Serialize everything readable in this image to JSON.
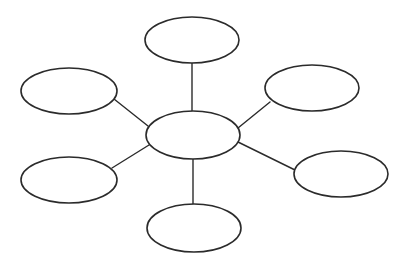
{
  "diagram": {
    "type": "bubble-map",
    "background": "#ffffff",
    "stroke_color": "#2b2b2b",
    "center": {
      "id": "center",
      "cx": 193,
      "cy": 135,
      "rx": 47,
      "ry": 24,
      "label": ""
    },
    "nodes": [
      {
        "id": "top",
        "cx": 192,
        "cy": 40,
        "rx": 47,
        "ry": 23,
        "label": ""
      },
      {
        "id": "top-left",
        "cx": 69,
        "cy": 91,
        "rx": 48,
        "ry": 23,
        "label": ""
      },
      {
        "id": "top-right",
        "cx": 312,
        "cy": 88,
        "rx": 47,
        "ry": 23,
        "label": ""
      },
      {
        "id": "bottom-left",
        "cx": 69,
        "cy": 180,
        "rx": 48,
        "ry": 23,
        "label": ""
      },
      {
        "id": "bottom-right",
        "cx": 341,
        "cy": 174,
        "rx": 47,
        "ry": 23,
        "label": ""
      },
      {
        "id": "bottom",
        "cx": 194,
        "cy": 228,
        "rx": 47,
        "ry": 24,
        "label": ""
      }
    ],
    "edges": [
      {
        "to": "top",
        "x1": 192,
        "y1": 111,
        "x2": 192,
        "y2": 63
      },
      {
        "to": "top-left",
        "x1": 148,
        "y1": 126,
        "x2": 114,
        "y2": 99
      },
      {
        "to": "top-right",
        "x1": 238,
        "y1": 128,
        "x2": 270,
        "y2": 102
      },
      {
        "to": "bottom-left",
        "x1": 149,
        "y1": 145,
        "x2": 112,
        "y2": 168
      },
      {
        "to": "bottom-right",
        "x1": 238,
        "y1": 142,
        "x2": 295,
        "y2": 170
      },
      {
        "to": "bottom",
        "x1": 193,
        "y1": 159,
        "x2": 193,
        "y2": 205
      }
    ]
  }
}
